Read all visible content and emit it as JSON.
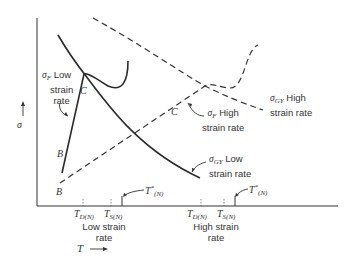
{
  "diagram": {
    "axes": {
      "y_label": "σ",
      "y_arrow": "↑",
      "x_label": "T",
      "x_arrow": "⟶"
    },
    "curves": [
      {
        "id": "sigma_gy_low",
        "style": "solid",
        "label_main": "σ",
        "label_sub": "GY",
        "label_text": "Low",
        "label_text2": "strain rate"
      },
      {
        "id": "sigma_f_low",
        "style": "solid",
        "label_main": "σ",
        "label_sub": "F",
        "label_text": "Low",
        "label_text2": "strain",
        "label_text3": "rate"
      },
      {
        "id": "sigma_gy_high",
        "style": "dashed",
        "label_main": "σ",
        "label_sub": "GY",
        "label_text": "High",
        "label_text2": "strain rate"
      },
      {
        "id": "sigma_f_high",
        "style": "dashed",
        "label_main": "σ",
        "label_sub": "F",
        "label_text": "High",
        "label_text2": "strain rate"
      }
    ],
    "points": {
      "B_low": "B",
      "C_low": "C",
      "B_high": "B",
      "C_high": "C"
    },
    "ticks": {
      "low": {
        "td_main": "T",
        "td_sub": "D(N)",
        "ts_main": "T",
        "ts_sub": "S(N)",
        "tstar_main": "T",
        "tstar_sup": "*",
        "tstar_sub": "(N)",
        "group_label1": "Low strain",
        "group_label2": "rate"
      },
      "high": {
        "td_main": "T",
        "td_sub": "D(N)",
        "ts_main": "T",
        "ts_sub": "S(N)",
        "tstar_main": "T",
        "tstar_sup": "*",
        "tstar_sub": "(N)",
        "group_label1": "High strain",
        "group_label2": "rate"
      }
    }
  }
}
